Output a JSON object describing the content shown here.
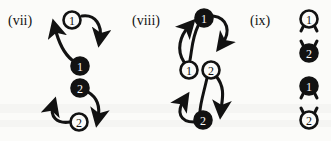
{
  "figure": {
    "caption_style": "roman-numeral-panels",
    "background_color": "#fbfbf9",
    "ink_color": "#121212",
    "panels": [
      {
        "id": "vii",
        "label": "(vii)",
        "nodes": [
          {
            "name": "node-1-open-top",
            "label": "1",
            "fill": "open",
            "cx": 72,
            "cy": 20
          },
          {
            "name": "node-1-solid",
            "label": "1",
            "fill": "solid",
            "cx": 80,
            "cy": 66
          },
          {
            "name": "node-2-solid",
            "label": "2",
            "fill": "solid",
            "cx": 80,
            "cy": 88
          },
          {
            "name": "node-2-open-bottom",
            "label": "2",
            "fill": "open",
            "cx": 79,
            "cy": 122
          }
        ],
        "arrow_count": 4
      },
      {
        "id": "viii",
        "label": "(viii)",
        "nodes": [
          {
            "name": "node-1-solid-top",
            "label": "1",
            "fill": "solid",
            "cx": 204,
            "cy": 18
          },
          {
            "name": "node-1-open-middle",
            "label": "1",
            "fill": "open",
            "cx": 189,
            "cy": 70
          },
          {
            "name": "node-2-open-middle",
            "label": "2",
            "fill": "open",
            "cx": 211,
            "cy": 70
          },
          {
            "name": "node-2-solid-bottom",
            "label": "2",
            "fill": "solid",
            "cx": 203,
            "cy": 120
          }
        ],
        "arrow_count": 4
      },
      {
        "id": "ix",
        "label": "(ix)",
        "nodes": [
          {
            "name": "node-1-open",
            "label": "1",
            "fill": "open",
            "cx": 309,
            "cy": 19,
            "ticks": "below"
          },
          {
            "name": "node-2-solid",
            "label": "2",
            "fill": "solid",
            "cx": 309,
            "cy": 53,
            "ticks": "above"
          },
          {
            "name": "node-1-solid",
            "label": "1",
            "fill": "solid",
            "cx": 309,
            "cy": 86,
            "ticks": "below"
          },
          {
            "name": "node-2-open",
            "label": "2",
            "fill": "open",
            "cx": 309,
            "cy": 120,
            "ticks": "above"
          }
        ],
        "arrow_count": 0
      }
    ]
  }
}
